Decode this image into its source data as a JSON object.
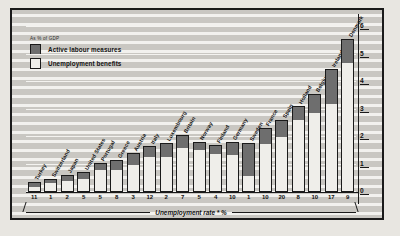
{
  "legend": {
    "caption": "As % of GDP",
    "items": [
      {
        "label": "Active labour measures",
        "color": "#6e6e6e"
      },
      {
        "label": "Unemployment benefits",
        "color": "#efeeea"
      }
    ]
  },
  "axis": {
    "x_title": "Unemployment rate * %",
    "y_ticks": [
      "0",
      "1",
      "2",
      "3",
      "4",
      "5",
      "6"
    ]
  },
  "chart_data": {
    "type": "bar",
    "title": "",
    "subtitle": "As % of GDP",
    "xlabel": "Unemployment rate * %",
    "ylabel": "As % of GDP",
    "ylim": [
      0,
      6.4
    ],
    "grid": true,
    "legend_position": "top-left",
    "stacked": true,
    "categories": [
      "Turkey",
      "Switzerland",
      "Japan",
      "United States",
      "Portugal",
      "Greece",
      "Austria",
      "Italy",
      "Luxembourg",
      "Britain",
      "Norway",
      "Finland",
      "Germany",
      "Sweden",
      "France",
      "Spain",
      "Holland",
      "Belgium",
      "Ireland",
      "Denmark"
    ],
    "x_tick_labels": [
      "11",
      "1",
      "2",
      "5",
      "5",
      "8",
      "3",
      "12",
      "2",
      "7",
      "5",
      "4",
      "10",
      "1",
      "10",
      "20",
      "8",
      "10",
      "17",
      "9"
    ],
    "series": [
      {
        "name": "Unemployment benefits",
        "color": "#efeeea",
        "values": [
          0.15,
          0.3,
          0.35,
          0.45,
          0.75,
          0.75,
          0.95,
          1.25,
          1.25,
          1.55,
          1.5,
          1.35,
          1.3,
          0.55,
          1.7,
          1.95,
          2.6,
          2.85,
          3.15,
          4.65
        ]
      },
      {
        "name": "Active labour measures",
        "color": "#6e6e6e",
        "values": [
          0.15,
          0.1,
          0.2,
          0.2,
          0.25,
          0.35,
          0.4,
          0.35,
          0.45,
          0.45,
          0.25,
          0.3,
          0.45,
          1.15,
          0.55,
          0.6,
          0.45,
          0.65,
          1.25,
          0.85
        ]
      }
    ],
    "totals": [
      0.3,
      0.4,
      0.55,
      0.65,
      1.0,
      1.1,
      1.35,
      1.6,
      1.7,
      2.0,
      1.75,
      1.65,
      1.75,
      1.7,
      2.25,
      2.55,
      3.05,
      3.5,
      4.4,
      5.5
    ]
  }
}
